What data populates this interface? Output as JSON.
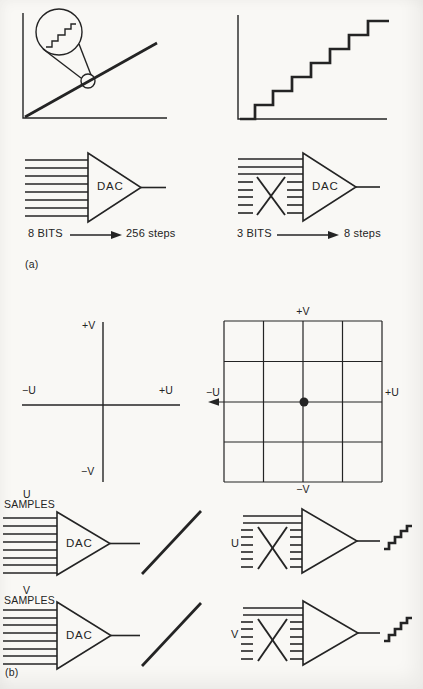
{
  "colors": {
    "paper": "#f9f8f5",
    "ink": "#242424"
  },
  "panel_a": {
    "label": "(a)",
    "dac_8bit": {
      "chip": "DAC",
      "bits": "8 BITS",
      "steps": "256 steps"
    },
    "dac_3bit": {
      "chip": "DAC",
      "bits": "3 BITS",
      "steps": "8 steps"
    }
  },
  "panel_b": {
    "label": "(b)",
    "uv_axes": {
      "up": "+V",
      "down": "−V",
      "left": "−U",
      "right": "+U"
    },
    "uv_grid": {
      "up": "+V",
      "down": "−V",
      "left": "−U",
      "right": "+U"
    },
    "u_dac": {
      "signal": "U",
      "samples": "SAMPLES",
      "chip": "DAC"
    },
    "v_dac": {
      "signal": "V",
      "samples": "SAMPLES",
      "chip": "DAC"
    },
    "u_reduced": {
      "label": "U"
    },
    "v_reduced": {
      "label": "V"
    }
  }
}
